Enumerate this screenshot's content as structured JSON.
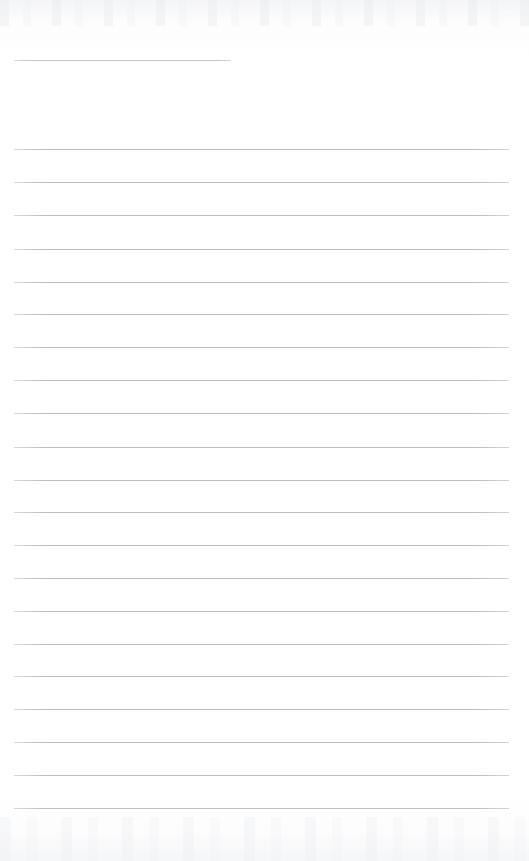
{
  "document": {
    "kind": "scanned-ruled-notepad-page",
    "title": "Blank ruled notepad page",
    "page_width": 529,
    "page_height": 861,
    "background_color": "#fdfdfd",
    "rule_color": "#b9bdc2",
    "rule_thickness_px": 1,
    "content_text": "",
    "handwriting_present": false,
    "printed_text_present": false
  },
  "header_rule": {
    "name": "title-rule",
    "description": "short ruled line near the top of the sheet",
    "x": 14,
    "y": 60,
    "width": 217,
    "color": "#c3c7cb"
  },
  "body_rules": {
    "count": 21,
    "left_x": 14,
    "right_x": 509,
    "width": 495,
    "spacing_px": 32.95,
    "first_y": 149,
    "last_y": 808,
    "y_positions": [
      149,
      182,
      215,
      249,
      282,
      314,
      347,
      380,
      413,
      447,
      480,
      512,
      545,
      578,
      611,
      644,
      676,
      709,
      742,
      775,
      808
    ]
  },
  "margins": {
    "top_px": 60,
    "bottom_px": 53,
    "left_px": 14,
    "right_px": 20
  },
  "scan_artifacts": {
    "top_band_height": 26,
    "bottom_band_height": 44,
    "tint_color": "#e9ebee"
  }
}
